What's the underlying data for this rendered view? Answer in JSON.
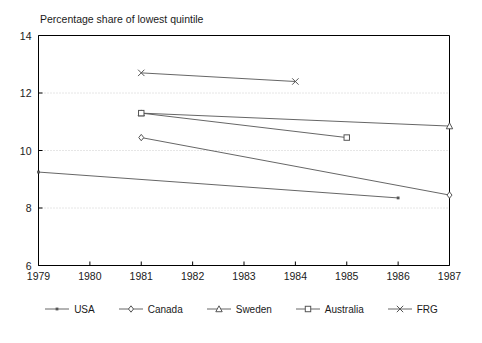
{
  "chart_data": {
    "type": "line",
    "title": "Percentage share of lowest quintile",
    "xlabel": "",
    "ylabel": "",
    "xlim": [
      1979,
      1987
    ],
    "ylim": [
      6,
      14
    ],
    "xticks": [
      1979,
      1980,
      1981,
      1982,
      1983,
      1984,
      1985,
      1986,
      1987
    ],
    "yticks": [
      6,
      8,
      10,
      12,
      14
    ],
    "grid": "horizontal-dotted",
    "legend_position": "bottom",
    "series": [
      {
        "name": "USA",
        "marker": "filled-dot",
        "x": [
          1979,
          1986
        ],
        "values": [
          9.25,
          8.35
        ]
      },
      {
        "name": "Canada",
        "marker": "diamond",
        "x": [
          1981,
          1987
        ],
        "values": [
          10.45,
          8.45
        ]
      },
      {
        "name": "Sweden",
        "marker": "triangle",
        "x": [
          1981,
          1987
        ],
        "values": [
          11.3,
          10.85
        ]
      },
      {
        "name": "Australia",
        "marker": "square",
        "x": [
          1981,
          1985
        ],
        "values": [
          11.3,
          10.45
        ]
      },
      {
        "name": "FRG",
        "marker": "cross",
        "x": [
          1981,
          1984
        ],
        "values": [
          12.7,
          12.4
        ]
      }
    ],
    "colors": {
      "line": "#555555",
      "axis": "#000000",
      "grid": "#cccccc",
      "text": "#1a1a1a",
      "background": "#ffffff"
    }
  }
}
